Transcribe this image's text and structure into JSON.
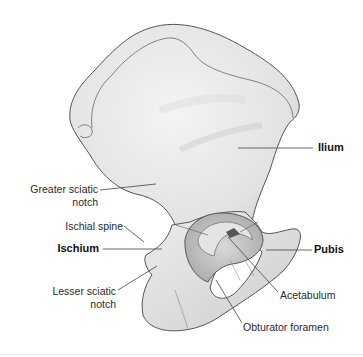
{
  "figure": {
    "colors": {
      "bone_fill": "#ececec",
      "bone_shadow": "#c9c9c9",
      "outline": "#555555",
      "leader_line": "#444444",
      "background": "#ffffff"
    }
  },
  "labels": {
    "ilium": "Ilium",
    "greater_sciatic_notch_1": "Greater sciatic",
    "greater_sciatic_notch_2": "notch",
    "ischial_spine": "Ischial spine",
    "ischium": "Ischium",
    "pubis": "Pubis",
    "lesser_sciatic_notch_1": "Lesser sciatic",
    "lesser_sciatic_notch_2": "notch",
    "acetabulum": "Acetabulum",
    "obturator_foramen": "Obturator foramen"
  }
}
